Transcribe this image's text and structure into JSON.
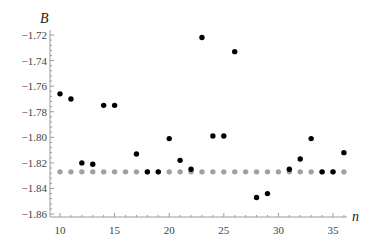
{
  "chart_data": {
    "type": "scatter",
    "title": "",
    "xlabel": "n",
    "ylabel": "B",
    "xlim": [
      9.1,
      36.9
    ],
    "ylim": [
      -1.86,
      -1.72
    ],
    "xticks": [
      10,
      15,
      20,
      25,
      30,
      35
    ],
    "yticks": [
      -1.72,
      -1.74,
      -1.76,
      -1.78,
      -1.8,
      -1.82,
      -1.84,
      -1.86
    ],
    "ytick_labels": [
      "-1.72",
      "-1.74",
      "-1.76",
      "-1.78",
      "-1.80",
      "-1.82",
      "-1.84",
      "-1.86"
    ],
    "grid": false,
    "legend": null,
    "series": [
      {
        "name": "computed B",
        "color": "#000000",
        "x": [
          10,
          11,
          12,
          13,
          14,
          15,
          17,
          18,
          19,
          20,
          21,
          22,
          23,
          24,
          25,
          26,
          28,
          29,
          31,
          32,
          33,
          34,
          35,
          36
        ],
        "y": [
          -1.766,
          -1.77,
          -1.82,
          -1.821,
          -1.775,
          -1.775,
          -1.813,
          -1.827,
          -1.827,
          -1.801,
          -1.818,
          -1.825,
          -1.722,
          -1.799,
          -1.799,
          -1.733,
          -1.847,
          -1.844,
          -1.825,
          -1.817,
          -1.801,
          -1.827,
          -1.827,
          -1.812
        ]
      },
      {
        "name": "reference B",
        "color": "#a0a0a0",
        "x": [
          10,
          11,
          12,
          13,
          14,
          15,
          16,
          17,
          18,
          19,
          20,
          21,
          22,
          23,
          24,
          25,
          26,
          27,
          28,
          29,
          30,
          31,
          32,
          33,
          34,
          35,
          36
        ],
        "y": [
          -1.827,
          -1.827,
          -1.827,
          -1.827,
          -1.827,
          -1.827,
          -1.827,
          -1.827,
          -1.827,
          -1.827,
          -1.827,
          -1.827,
          -1.827,
          -1.827,
          -1.827,
          -1.827,
          -1.827,
          -1.827,
          -1.827,
          -1.827,
          -1.827,
          -1.827,
          -1.827,
          -1.827,
          -1.827,
          -1.827,
          -1.827
        ]
      }
    ]
  }
}
